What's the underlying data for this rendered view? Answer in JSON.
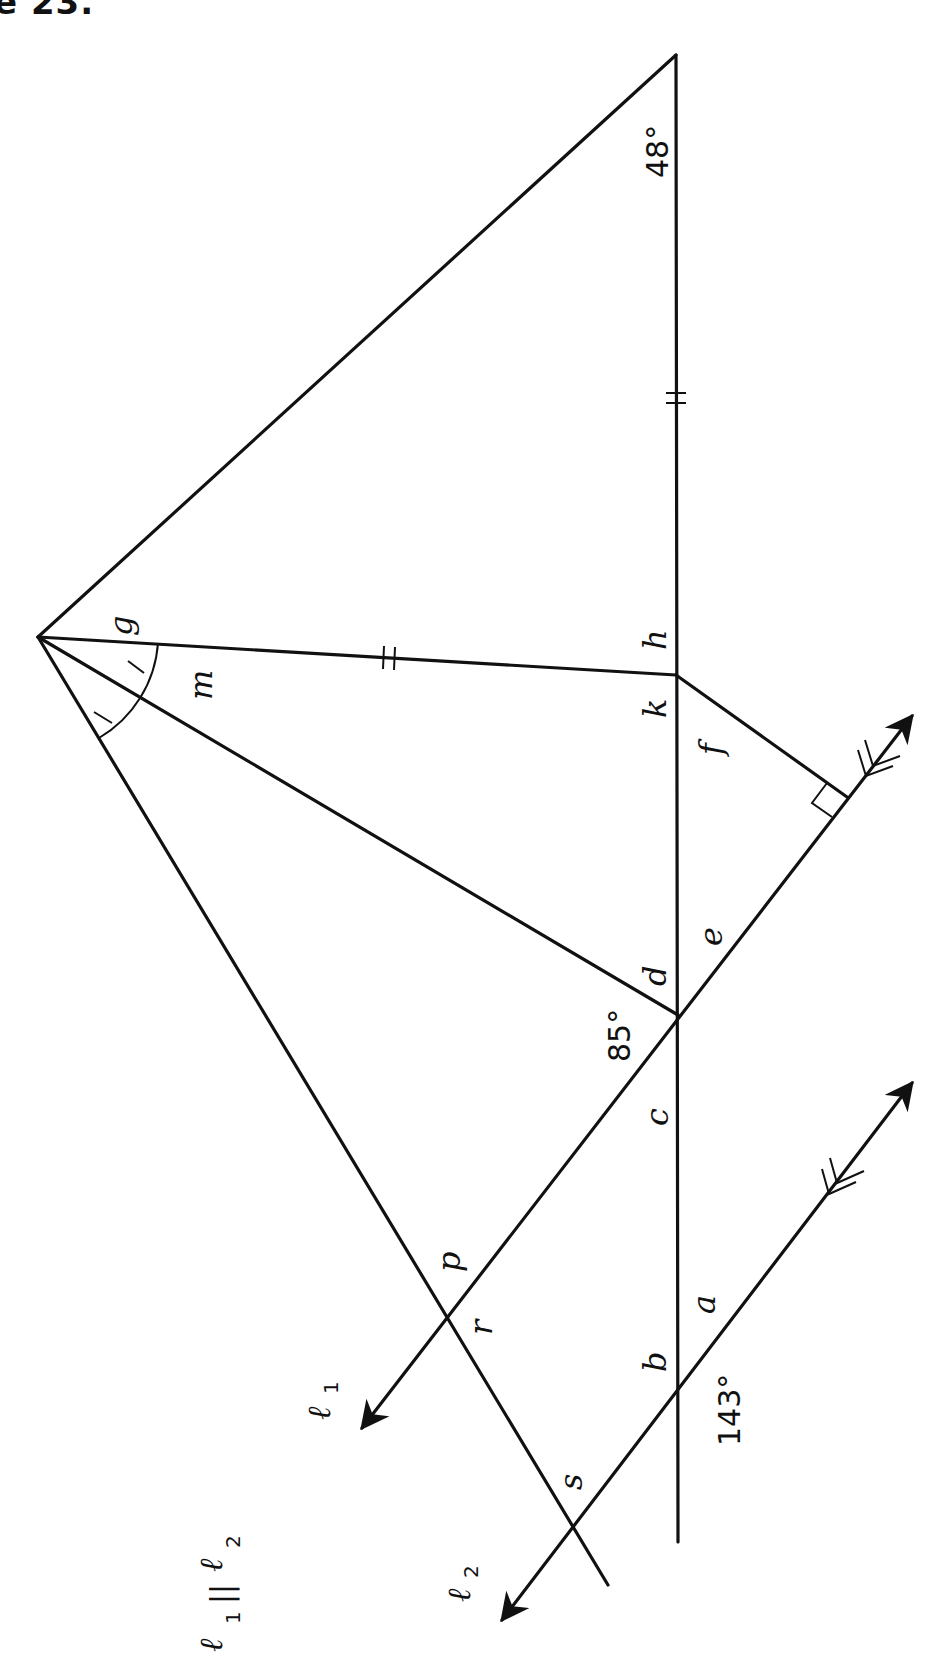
{
  "title": "e 23.",
  "diagram": {
    "rotation_deg": -90,
    "angle_labels": {
      "g": "g",
      "h": "h",
      "k": "k",
      "m": "m",
      "f": "f",
      "d": "d",
      "e": "e",
      "c": "c",
      "p": "p",
      "r": "r",
      "a": "a",
      "b": "b",
      "s": "s"
    },
    "given_angles": {
      "top_vertex": "48°",
      "at_d_intersection": "85°",
      "at_b_intersection": "143°"
    },
    "lines": {
      "l1": "ℓ",
      "l1_sub": "1",
      "l2": "ℓ",
      "l2_sub": "2"
    },
    "parallel_statement": {
      "left": "ℓ",
      "left_sub": "1",
      "symbol": "||",
      "right": "ℓ",
      "right_sub": "2"
    },
    "marks": {
      "congruent_segments": "double tick",
      "congruent_angles": "single tick arcs",
      "right_angle": "square at foot of perpendicular",
      "parallel_arrows": "double arrowheads"
    }
  }
}
